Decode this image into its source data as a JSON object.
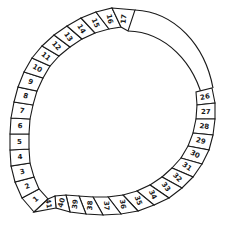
{
  "diagram": {
    "type": "numbered segmented ring",
    "stroke_color": "#1a1a1a",
    "background": "#ffffff",
    "left_arc_segments": [
      "1",
      "2",
      "3",
      "4",
      "5",
      "6",
      "7",
      "8",
      "9",
      "10",
      "11",
      "12",
      "13",
      "14",
      "15",
      "16",
      "17"
    ],
    "right_arc_segments": [
      "26",
      "27",
      "28",
      "29",
      "30",
      "31",
      "32",
      "33",
      "34",
      "35",
      "36",
      "37",
      "38",
      "39",
      "40",
      "41"
    ],
    "unnumbered_band": "plain curved band connecting segment 17 to segment 26 (segments 18–25 not drawn)"
  }
}
